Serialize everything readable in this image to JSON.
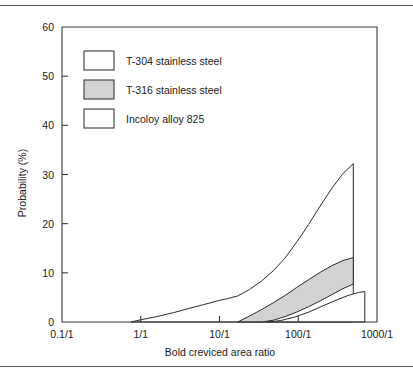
{
  "figure": {
    "background_color": "#ffffff",
    "rule_color": "#555555",
    "axis_color": "#3a3a3a",
    "curve_color": "#2b2b2b"
  },
  "legend": {
    "position": "top-left-inside",
    "items": [
      {
        "label": "T-304 stainless steel",
        "swatch_fill": "#ffffff",
        "swatch_stroke": "#3a3a3a"
      },
      {
        "label": "T-316 stainless steel",
        "swatch_fill": "#d2d2d2",
        "swatch_stroke": "#3a3a3a"
      },
      {
        "label": "Incoloy alloy 825",
        "swatch_fill": "#ffffff",
        "swatch_stroke": "#3a3a3a"
      }
    ]
  },
  "chart_data": {
    "type": "area",
    "title": "",
    "subtitle": "",
    "xlabel": "Bold creviced area ratio",
    "ylabel": "Probability (%)",
    "xscale": "log",
    "yscale": "linear",
    "xlim": [
      0.1,
      1000
    ],
    "ylim": [
      0,
      60
    ],
    "grid": false,
    "xticks": [
      0.1,
      1,
      10,
      100,
      1000
    ],
    "xtick_labels": [
      "0.1/1",
      "1/1",
      "10/1",
      "100/1",
      "1000/1"
    ],
    "yticks": [
      0,
      10,
      20,
      30,
      40,
      50,
      60
    ],
    "ytick_labels": [
      "0",
      "10",
      "20",
      "30",
      "40",
      "50",
      "60"
    ],
    "legend_position": "upper left",
    "series": [
      {
        "name": "T-304 stainless steel",
        "fill": "#ffffff",
        "type": "band",
        "note": "Single envelope curve rising from 0 near 1/1 to a peak of about 32% near 500/1, then dropping vertically to 0.",
        "upper": [
          [
            0.75,
            0.0
          ],
          [
            1.0,
            0.45
          ],
          [
            1.6,
            1.1
          ],
          [
            2.6,
            1.9
          ],
          [
            4.2,
            2.8
          ],
          [
            6.5,
            3.6
          ],
          [
            10.0,
            4.4
          ],
          [
            13.0,
            4.8
          ],
          [
            17.0,
            5.3
          ],
          [
            24.0,
            6.6
          ],
          [
            34.0,
            8.3
          ],
          [
            48.0,
            10.4
          ],
          [
            68.0,
            13.0
          ],
          [
            95.0,
            16.2
          ],
          [
            135.0,
            19.8
          ],
          [
            190.0,
            23.6
          ],
          [
            270.0,
            27.3
          ],
          [
            370.0,
            30.2
          ],
          [
            470.0,
            31.8
          ],
          [
            500.0,
            32.2
          ]
        ],
        "lower": [
          [
            0.75,
            0.0
          ],
          [
            500.0,
            0.0
          ]
        ]
      },
      {
        "name": "T-316 stainless steel",
        "fill": "#d2d2d2",
        "type": "band",
        "note": "Shaded band opening near 17/1 at 0% and widening to span roughly 7.7%-13% at 500/1.",
        "upper": [
          [
            17.0,
            0.0
          ],
          [
            24.0,
            1.2
          ],
          [
            34.0,
            2.5
          ],
          [
            48.0,
            3.9
          ],
          [
            68.0,
            5.4
          ],
          [
            95.0,
            7.0
          ],
          [
            135.0,
            8.6
          ],
          [
            190.0,
            10.1
          ],
          [
            270.0,
            11.5
          ],
          [
            370.0,
            12.5
          ],
          [
            500.0,
            13.1
          ]
        ],
        "lower": [
          [
            17.0,
            0.0
          ],
          [
            34.0,
            0.0
          ],
          [
            48.0,
            0.35
          ],
          [
            68.0,
            1.1
          ],
          [
            95.0,
            2.0
          ],
          [
            135.0,
            3.1
          ],
          [
            190.0,
            4.3
          ],
          [
            270.0,
            5.6
          ],
          [
            370.0,
            6.8
          ],
          [
            500.0,
            7.7
          ]
        ]
      },
      {
        "name": "Incoloy alloy 825",
        "fill": "#ffffff",
        "type": "band",
        "note": "Lowest envelope starting near 40/1 at 0% and reaching about 6.2% at 700/1, closed by a vertical right edge.",
        "upper": [
          [
            40.0,
            0.0
          ],
          [
            60.0,
            0.3
          ],
          [
            90.0,
            1.0
          ],
          [
            135.0,
            2.0
          ],
          [
            200.0,
            3.2
          ],
          [
            300.0,
            4.4
          ],
          [
            430.0,
            5.4
          ],
          [
            580.0,
            6.0
          ],
          [
            700.0,
            6.2
          ]
        ],
        "lower": [
          [
            40.0,
            0.0
          ],
          [
            700.0,
            0.0
          ]
        ]
      }
    ]
  }
}
